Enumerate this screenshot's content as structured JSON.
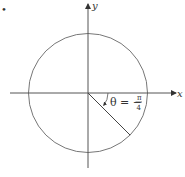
{
  "diagram": {
    "x_axis_label": "x",
    "y_axis_label": "y",
    "angle": {
      "label_prefix": "θ = −",
      "numerator": "π",
      "denominator": "4",
      "radians": -0.7853981634,
      "direction": "clockwise"
    },
    "marker_glyph": "•",
    "colors": {
      "line": "#555555",
      "circle": "#777777",
      "text": "#333333"
    }
  }
}
